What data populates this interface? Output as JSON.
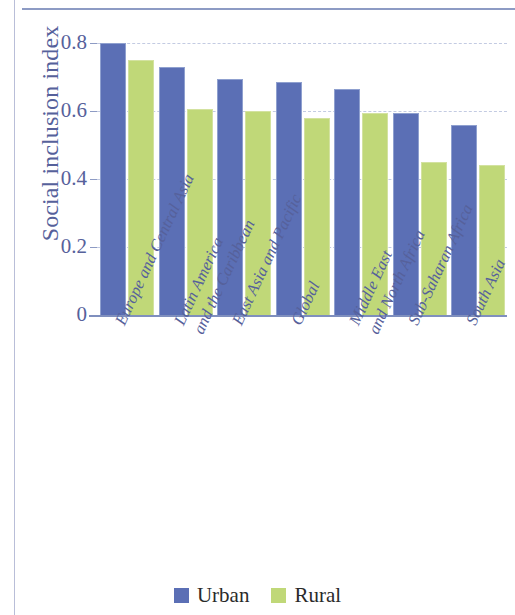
{
  "chart_data": {
    "type": "bar",
    "title": "",
    "subtitle": "",
    "xlabel": "",
    "ylabel": "Social inclusion index",
    "ylim": [
      0,
      0.88
    ],
    "yticks": [
      "0",
      "0.2",
      "0.4",
      "0.6",
      "0.8"
    ],
    "ytick_values": [
      0,
      0.2,
      0.4,
      0.6,
      0.8
    ],
    "grid": "horizontal-dashed",
    "legend_position": "bottom-center",
    "categories": [
      "Europe and Central Asia",
      "Latin America\nand the Caribbean",
      "East Asia and Pacific",
      "Global",
      "Middle East\nand North Africa",
      "Sub-Saharan Africa",
      "South Asia"
    ],
    "series": [
      {
        "name": "Urban",
        "color": "#5b6fb5",
        "values": [
          0.8,
          0.73,
          0.695,
          0.685,
          0.665,
          0.595,
          0.56
        ]
      },
      {
        "name": "Rural",
        "color": "#c0d878",
        "values": [
          0.75,
          0.605,
          0.6,
          0.58,
          0.595,
          0.45,
          0.44
        ]
      }
    ]
  },
  "axis": {
    "y_title": "Social inclusion index"
  },
  "categories_display": [
    {
      "line1": "Europe and Central Asia",
      "line2": ""
    },
    {
      "line1": "Latin America",
      "line2": "and the Caribbean"
    },
    {
      "line1": "East Asia and Pacific",
      "line2": ""
    },
    {
      "line1": "Global",
      "line2": ""
    },
    {
      "line1": "Middle East",
      "line2": "and North Africa"
    },
    {
      "line1": "Sub-Saharan Africa",
      "line2": ""
    },
    {
      "line1": "South Asia",
      "line2": ""
    }
  ],
  "legend": {
    "items": [
      {
        "label": "Urban",
        "color": "#5b6fb5"
      },
      {
        "label": "Rural",
        "color": "#c0d878"
      }
    ]
  },
  "colors": {
    "urban": "#5b6fb5",
    "rural": "#c0d878",
    "axis_text": "#56619b",
    "gridline": "#c3cbe2",
    "rule": "#8d9bc4"
  }
}
